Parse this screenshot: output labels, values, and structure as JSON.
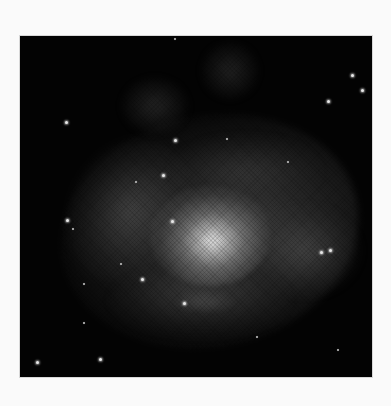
{
  "image": {
    "subject": "spiral galaxy",
    "style": "grayscale astronomical photograph",
    "background_color": "#fafafa",
    "frame_color": "#030303",
    "frame": {
      "left": 20,
      "top": 36,
      "width": 352,
      "height": 341
    }
  },
  "stars": [
    {
      "x": 46,
      "y": 86,
      "size": "normal"
    },
    {
      "x": 155,
      "y": 3,
      "size": "small"
    },
    {
      "x": 332,
      "y": 39,
      "size": "normal"
    },
    {
      "x": 342,
      "y": 54,
      "size": "normal"
    },
    {
      "x": 308,
      "y": 65,
      "size": "normal"
    },
    {
      "x": 155,
      "y": 104,
      "size": "normal"
    },
    {
      "x": 143,
      "y": 139,
      "size": "normal"
    },
    {
      "x": 116,
      "y": 146,
      "size": "small"
    },
    {
      "x": 152,
      "y": 185,
      "size": "normal"
    },
    {
      "x": 47,
      "y": 184,
      "size": "normal"
    },
    {
      "x": 53,
      "y": 193,
      "size": "small"
    },
    {
      "x": 301,
      "y": 216,
      "size": "normal"
    },
    {
      "x": 310,
      "y": 214,
      "size": "normal"
    },
    {
      "x": 122,
      "y": 243,
      "size": "normal"
    },
    {
      "x": 64,
      "y": 248,
      "size": "small"
    },
    {
      "x": 164,
      "y": 267,
      "size": "normal"
    },
    {
      "x": 64,
      "y": 287,
      "size": "small"
    },
    {
      "x": 80,
      "y": 323,
      "size": "normal"
    },
    {
      "x": 17,
      "y": 326,
      "size": "normal"
    },
    {
      "x": 237,
      "y": 301,
      "size": "small"
    },
    {
      "x": 318,
      "y": 314,
      "size": "small"
    },
    {
      "x": 207,
      "y": 103,
      "size": "small"
    },
    {
      "x": 101,
      "y": 228,
      "size": "small"
    },
    {
      "x": 268,
      "y": 126,
      "size": "small"
    }
  ]
}
